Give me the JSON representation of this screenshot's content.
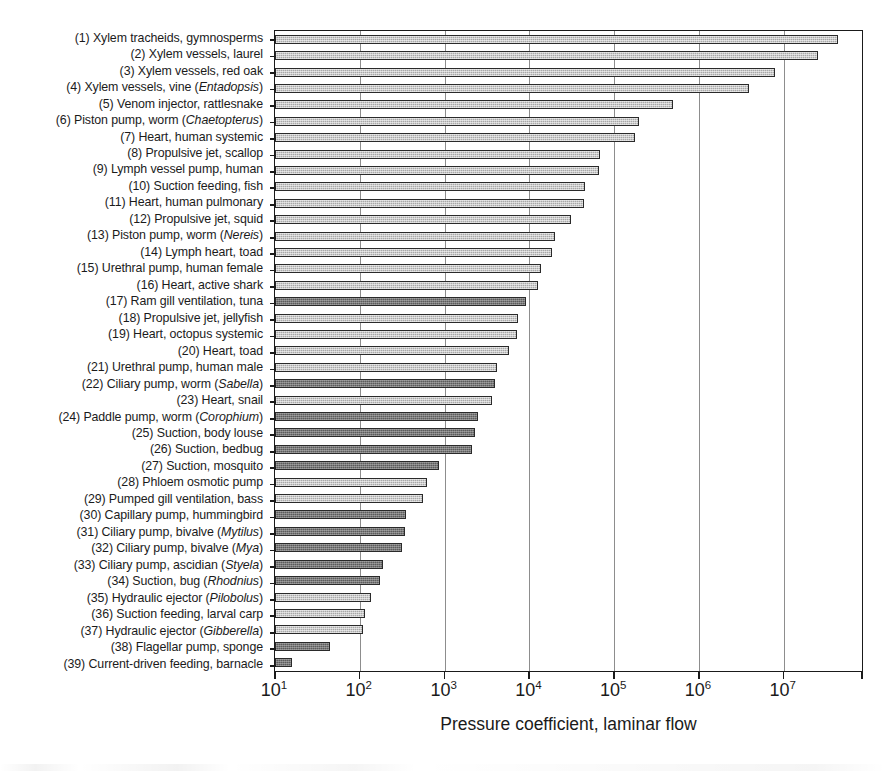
{
  "chart_data": {
    "type": "bar",
    "orientation": "horizontal",
    "title": "",
    "xlabel": "Pressure coefficient, laminar flow",
    "ylabel": "",
    "xscale": "log",
    "xlim": [
      10,
      87000000
    ],
    "xtick_labels": [
      "10¹",
      "10²",
      "10³",
      "10⁴",
      "10⁵",
      "10⁶",
      "10⁷"
    ],
    "xtick_mantissa": [
      "10",
      "10",
      "10",
      "10",
      "10",
      "10",
      "10"
    ],
    "xtick_exponents": [
      "1",
      "2",
      "3",
      "4",
      "5",
      "6",
      "7"
    ],
    "xtick_values": [
      10,
      100,
      1000,
      10000,
      100000,
      1000000,
      10000000
    ],
    "grid": "vertical-only",
    "legend": "none",
    "bar_fill_light": "#a8a8a8",
    "bar_fill_dark": "#5c5c5c",
    "bar_edge": "#2a2a2a",
    "axis_color": "#1a1a1a",
    "gridline_color": "#8d8d8d",
    "categories": [
      {
        "n": "(1)",
        "label": "Xylem tracheids, gymnosperms",
        "italic": "",
        "value": 44000000,
        "shade": "light"
      },
      {
        "n": "(2)",
        "label": "Xylem vessels, laurel",
        "italic": "",
        "value": 25000000,
        "shade": "light"
      },
      {
        "n": "(3)",
        "label": "Xylem vessels, red oak",
        "italic": "",
        "value": 7800000,
        "shade": "light"
      },
      {
        "n": "(4)",
        "label": "Xylem vessels, vine",
        "italic": "Entadopsis",
        "value": 3900000,
        "shade": "light"
      },
      {
        "n": "(5)",
        "label": "Venom injector, rattlesnake",
        "italic": "",
        "value": 490000,
        "shade": "light"
      },
      {
        "n": "(6)",
        "label": "Piston pump, worm",
        "italic": "Chaetopterus",
        "value": 195000,
        "shade": "light"
      },
      {
        "n": "(7)",
        "label": "Heart, human systemic",
        "italic": "",
        "value": 175000,
        "shade": "light"
      },
      {
        "n": "(8)",
        "label": "Propulsive jet, scallop",
        "italic": "",
        "value": 68000,
        "shade": "light"
      },
      {
        "n": "(9)",
        "label": "Lymph vessel pump, human",
        "italic": "",
        "value": 66000,
        "shade": "light"
      },
      {
        "n": "(10)",
        "label": "Suction feeding, fish",
        "italic": "",
        "value": 45000,
        "shade": "light"
      },
      {
        "n": "(11)",
        "label": "Heart, human pulmonary",
        "italic": "",
        "value": 44000,
        "shade": "light"
      },
      {
        "n": "(12)",
        "label": "Propulsive jet, squid",
        "italic": "",
        "value": 31000,
        "shade": "light"
      },
      {
        "n": "(13)",
        "label": "Piston pump, worm",
        "italic": "Nereis",
        "value": 20000,
        "shade": "light"
      },
      {
        "n": "(14)",
        "label": "Lymph heart, toad",
        "italic": "",
        "value": 18500,
        "shade": "light"
      },
      {
        "n": "(15)",
        "label": "Urethral pump, human female",
        "italic": "",
        "value": 13500,
        "shade": "light"
      },
      {
        "n": "(16)",
        "label": "Heart, active shark",
        "italic": "",
        "value": 12500,
        "shade": "light"
      },
      {
        "n": "(17)",
        "label": "Ram gill ventilation, tuna",
        "italic": "",
        "value": 9000,
        "shade": "dark"
      },
      {
        "n": "(18)",
        "label": "Propulsive jet, jellyfish",
        "italic": "",
        "value": 7300,
        "shade": "light"
      },
      {
        "n": "(19)",
        "label": "Heart, octopus systemic",
        "italic": "",
        "value": 7200,
        "shade": "light"
      },
      {
        "n": "(20)",
        "label": "Heart, toad",
        "italic": "",
        "value": 5700,
        "shade": "light"
      },
      {
        "n": "(21)",
        "label": "Urethral pump, human male",
        "italic": "",
        "value": 4100,
        "shade": "light"
      },
      {
        "n": "(22)",
        "label": "Ciliary pump, worm",
        "italic": "Sabella",
        "value": 3900,
        "shade": "dark"
      },
      {
        "n": "(23)",
        "label": "Heart, snail",
        "italic": "",
        "value": 3600,
        "shade": "light"
      },
      {
        "n": "(24)",
        "label": "Paddle pump, worm",
        "italic": "Corophium",
        "value": 2500,
        "shade": "dark"
      },
      {
        "n": "(25)",
        "label": "Suction, body louse",
        "italic": "",
        "value": 2300,
        "shade": "dark"
      },
      {
        "n": "(26)",
        "label": "Suction, bedbug",
        "italic": "",
        "value": 2100,
        "shade": "dark"
      },
      {
        "n": "(27)",
        "label": "Suction, mosquito",
        "italic": "",
        "value": 850,
        "shade": "dark"
      },
      {
        "n": "(28)",
        "label": "Phloem osmotic pump",
        "italic": "",
        "value": 620,
        "shade": "light"
      },
      {
        "n": "(29)",
        "label": "Pumped gill ventilation, bass",
        "italic": "",
        "value": 560,
        "shade": "light"
      },
      {
        "n": "(30)",
        "label": "Capillary pump, hummingbird",
        "italic": "",
        "value": 350,
        "shade": "dark"
      },
      {
        "n": "(31)",
        "label": "Ciliary pump, bivalve",
        "italic": "Mytilus",
        "value": 340,
        "shade": "dark"
      },
      {
        "n": "(32)",
        "label": "Ciliary pump, bivalve",
        "italic": "Mya",
        "value": 310,
        "shade": "dark"
      },
      {
        "n": "(33)",
        "label": "Ciliary pump, ascidian",
        "italic": "Styela",
        "value": 185,
        "shade": "dark"
      },
      {
        "n": "(34)",
        "label": "Suction, bug",
        "italic": "Rhodnius",
        "value": 175,
        "shade": "dark"
      },
      {
        "n": "(35)",
        "label": "Hydraulic ejector",
        "italic": "Pilobolus",
        "value": 135,
        "shade": "light"
      },
      {
        "n": "(36)",
        "label": "Suction feeding, larval carp",
        "italic": "",
        "value": 115,
        "shade": "light"
      },
      {
        "n": "(37)",
        "label": "Hydraulic ejector",
        "italic": "Gibberella",
        "value": 110,
        "shade": "light"
      },
      {
        "n": "(38)",
        "label": "Flagellar pump, sponge",
        "italic": "",
        "value": 45,
        "shade": "dark"
      },
      {
        "n": "(39)",
        "label": "Current-driven feeding, barnacle",
        "italic": "",
        "value": 16,
        "shade": "dark"
      }
    ]
  }
}
